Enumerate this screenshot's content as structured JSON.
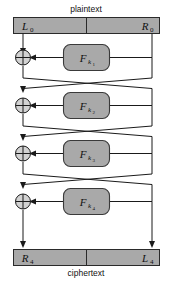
{
  "diagram": {
    "title_top": "plaintext",
    "title_bottom": "ciphertext",
    "type": "feistel-network",
    "rounds": 4,
    "colors": {
      "bar_fill": "#a9a9a9",
      "box_fill": "#a9a9a9",
      "xor_fill": "#d2d2d2",
      "line": "#1a1a1a",
      "background": "#ffffff"
    },
    "top_bar": {
      "left_label": "L",
      "left_sub": "0",
      "right_label": "R",
      "right_sub": "0"
    },
    "bottom_bar": {
      "left_label": "R",
      "left_sub": "4",
      "right_label": "L",
      "right_sub": "4"
    },
    "round_boxes": [
      {
        "fn": "F",
        "key": "k",
        "index": "1"
      },
      {
        "fn": "F",
        "key": "k",
        "index": "2"
      },
      {
        "fn": "F",
        "key": "k",
        "index": "3"
      },
      {
        "fn": "F",
        "key": "k",
        "index": "4"
      }
    ],
    "xor_symbol": "+"
  }
}
